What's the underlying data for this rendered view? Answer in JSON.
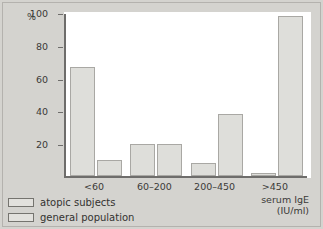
{
  "chart_data": {
    "type": "bar",
    "title": "",
    "xlabel": "serum IgE (IU/ml)",
    "ylabel": "%",
    "categories": [
      "<60",
      "60–200",
      "200–450",
      ">450"
    ],
    "series": [
      {
        "name": "atopic subjects",
        "values": [
          67.5,
          19.5,
          8,
          2
        ]
      },
      {
        "name": "general population",
        "values": [
          10,
          19.5,
          38,
          99
        ]
      }
    ],
    "ylim": [
      0,
      100
    ],
    "yticks": [
      20,
      40,
      60,
      80,
      100
    ],
    "ytick_labels": [
      "20",
      "40",
      "60",
      "80",
      "100"
    ],
    "grid": false,
    "legend_position": "bottom-left",
    "colors": {
      "bar_fill": "#dededa",
      "bar_border": "#a9a8a4",
      "axis": "#6e6d6b",
      "text": "#3b3a38",
      "background": "#d4d3cf",
      "plot_background": "#ffffff"
    }
  },
  "axis": {
    "percent_symbol": "%",
    "x_title_line1": "serum IgE",
    "x_title_line2": "(IU/ml)"
  },
  "legend": {
    "items": [
      {
        "label": "atopic subjects"
      },
      {
        "label": "general population"
      }
    ]
  }
}
